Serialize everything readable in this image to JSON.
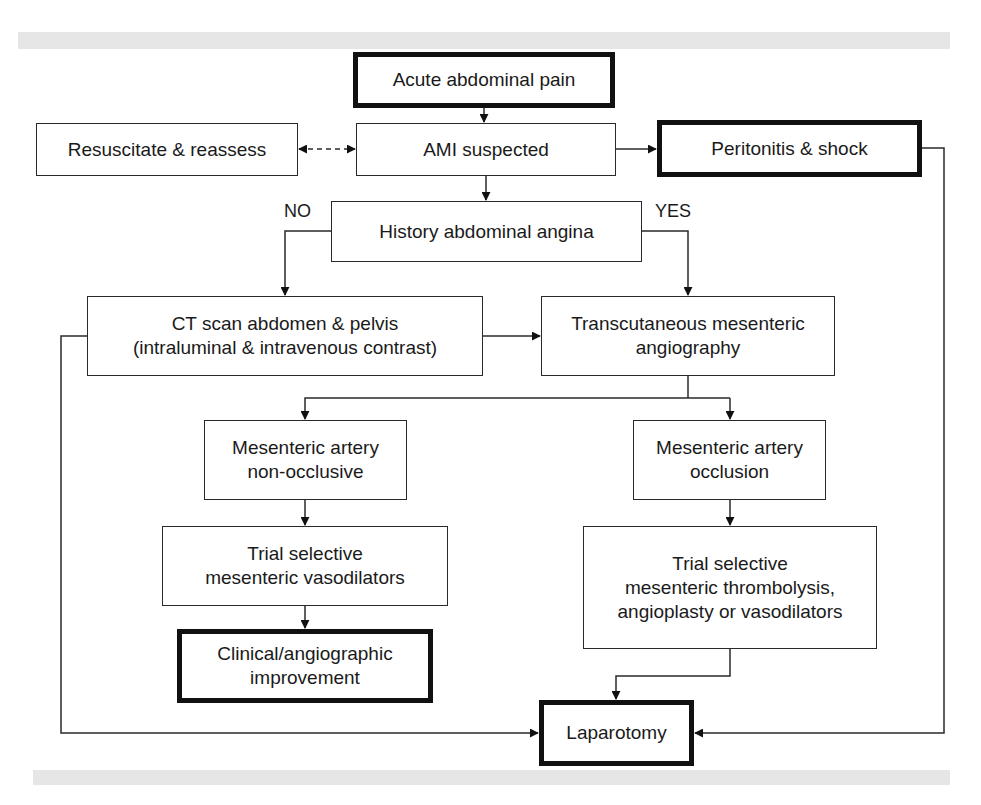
{
  "diagram": {
    "type": "flowchart",
    "nodes": {
      "acute": "Acute abdominal pain",
      "resuscitate": "Resuscitate & reassess",
      "ami": "AMI suspected",
      "peritonitis": "Peritonitis & shock",
      "history": "History abdominal angina",
      "ct": "CT scan abdomen & pelvis\n(intraluminal & intravenous contrast)",
      "angiography": "Transcutaneous mesenteric\nangiography",
      "nonocclusive": "Mesenteric artery\nnon-occlusive",
      "occlusion": "Mesenteric artery\nocclusion",
      "vasodilators": "Trial selective\nmesenteric vasodilators",
      "thrombolysis": "Trial selective\nmesenteric thrombolysis,\nangioplasty or vasodilators",
      "improvement": "Clinical/angiographic\nimprovement",
      "laparotomy": "Laparotomy"
    },
    "labels": {
      "no": "NO",
      "yes": "YES"
    },
    "edges": [
      [
        "acute",
        "ami"
      ],
      [
        "ami",
        "resuscitate",
        "bidirectional-dashed"
      ],
      [
        "ami",
        "peritonitis"
      ],
      [
        "ami",
        "history"
      ],
      [
        "history",
        "ct",
        "NO"
      ],
      [
        "history",
        "angiography",
        "YES"
      ],
      [
        "ct",
        "angiography"
      ],
      [
        "angiography",
        "nonocclusive"
      ],
      [
        "angiography",
        "occlusion"
      ],
      [
        "nonocclusive",
        "vasodilators"
      ],
      [
        "vasodilators",
        "improvement"
      ],
      [
        "occlusion",
        "thrombolysis"
      ],
      [
        "thrombolysis",
        "laparotomy"
      ],
      [
        "ct",
        "laparotomy"
      ],
      [
        "peritonitis",
        "laparotomy"
      ]
    ]
  }
}
